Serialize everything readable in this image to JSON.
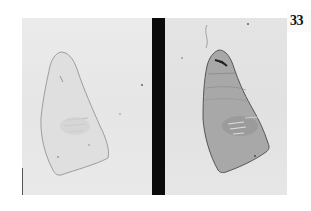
{
  "figure": {
    "plate_number": "33",
    "panels": [
      {
        "id": "left",
        "description": "specimen section, light stain",
        "specimen_fill": "#dedede",
        "specimen_outline": "#8a8a8a"
      },
      {
        "id": "right",
        "description": "specimen section, dark stain",
        "specimen_fill": "#a9a9a9",
        "specimen_outline": "#4a4a4a"
      }
    ],
    "colors": {
      "background": "#ffffff",
      "panel_bg": "#e8e8e8",
      "divider": "#0b0b0b"
    }
  }
}
